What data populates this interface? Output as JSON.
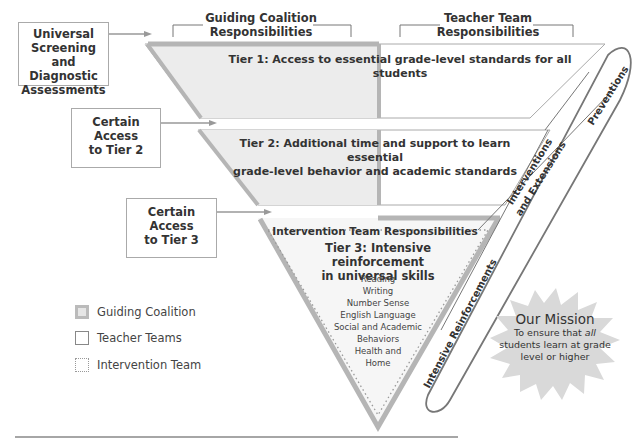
{
  "headers": {
    "guiding_coalition": [
      "Guiding Coalition",
      "Responsibilities"
    ],
    "teacher_team": [
      "Teacher Team",
      "Responsibilities"
    ]
  },
  "left_boxes": {
    "screening": [
      "Universal",
      "Screening and",
      "Diagnostic",
      "Assessments"
    ],
    "tier2_access": [
      "Certain Access",
      "to Tier 2"
    ],
    "tier3_access": [
      "Certain Access",
      "to Tier 3"
    ]
  },
  "tiers": {
    "tier1": "Tier 1: Access to essential grade-level standards for all students",
    "tier2": [
      "Tier 2: Additional time and support to learn essential",
      "grade-level behavior and academic standards"
    ],
    "tier3_header": "Intervention Team Responsibilities",
    "tier3_title": [
      "Tier 3: Intensive reinforcement",
      "in universal skills"
    ],
    "tier3_skills": [
      "Reading",
      "Writing",
      "Number Sense",
      "English Language",
      "Social and Academic",
      "Behaviors",
      "Health and",
      "Home"
    ]
  },
  "ellipse_labels": {
    "preventions": "Preventions",
    "interventions": [
      "Interventions",
      "and Extensions"
    ],
    "intensive": "Intensive Reinforcements"
  },
  "legend": [
    {
      "label": "Guiding Coalition",
      "style": "thick-gray"
    },
    {
      "label": "Teacher Teams",
      "style": "thin-outline"
    },
    {
      "label": "Intervention Team",
      "style": "dotted"
    }
  ],
  "mission": {
    "title": "Our Mission",
    "line1_pre": "To ensure that ",
    "line1_em": "all",
    "line2": "students learn at grade",
    "line3": "level or higher"
  },
  "colors": {
    "guiding_fill": "#ececec",
    "guiding_border": "#b5b5b5",
    "outline": "#999999",
    "ellipse": "#777777",
    "starburst": "#d9d9d9"
  }
}
